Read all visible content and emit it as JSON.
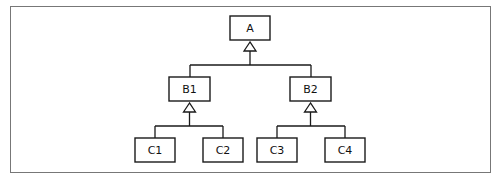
{
  "diagram": {
    "type": "class-hierarchy",
    "nodes": {
      "a": {
        "label": "A"
      },
      "b1": {
        "label": "B1"
      },
      "b2": {
        "label": "B2"
      },
      "c1": {
        "label": "C1"
      },
      "c2": {
        "label": "C2"
      },
      "c3": {
        "label": "C3"
      },
      "c4": {
        "label": "C4"
      }
    },
    "edges": [
      {
        "from": "B1",
        "to": "A",
        "kind": "inheritance"
      },
      {
        "from": "B2",
        "to": "A",
        "kind": "inheritance"
      },
      {
        "from": "C1",
        "to": "B1",
        "kind": "inheritance"
      },
      {
        "from": "C2",
        "to": "B1",
        "kind": "inheritance"
      },
      {
        "from": "C3",
        "to": "B2",
        "kind": "inheritance"
      },
      {
        "from": "C4",
        "to": "B2",
        "kind": "inheritance"
      }
    ]
  }
}
